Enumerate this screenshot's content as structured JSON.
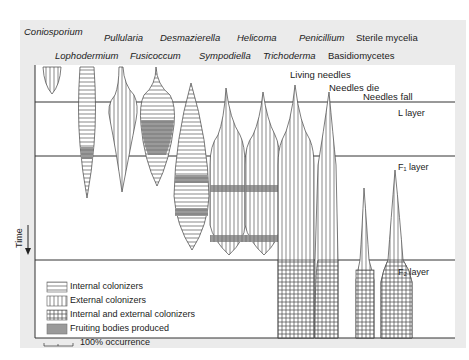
{
  "genera_row1": [
    {
      "name": "Coniosporium",
      "italic": true
    },
    {
      "name": "Pullularia",
      "italic": true
    },
    {
      "name": "Desmazierella",
      "italic": true
    },
    {
      "name": "Helicoma",
      "italic": true
    },
    {
      "name": "Penicillium",
      "italic": true
    },
    {
      "name": "Sterile mycelia",
      "italic": false
    }
  ],
  "genera_row2": [
    {
      "name": "Lophodermium",
      "italic": true
    },
    {
      "name": "Fusicoccum",
      "italic": true
    },
    {
      "name": "Sympodiella",
      "italic": true
    },
    {
      "name": "Trichoderma",
      "italic": true
    },
    {
      "name": "Basidiomycetes",
      "italic": false
    }
  ],
  "stages": {
    "living": "Living needles",
    "die": "Needles die",
    "fall": "Needles fall"
  },
  "layers": {
    "l": "L layer",
    "f1": "F₁ layer",
    "f2": "F₂ layer"
  },
  "axis": {
    "time": "Time"
  },
  "legend": {
    "internal": "Internal colonizers",
    "external": "External colonizers",
    "both": "Internal and external colonizers",
    "fruiting": "Fruiting bodies produced",
    "scale": "100% occurrence"
  },
  "colors": {
    "panel": "#ebebeb",
    "plot_bg": "#ffffff",
    "line": "#333333",
    "fruiting": "#8a8a8a"
  }
}
